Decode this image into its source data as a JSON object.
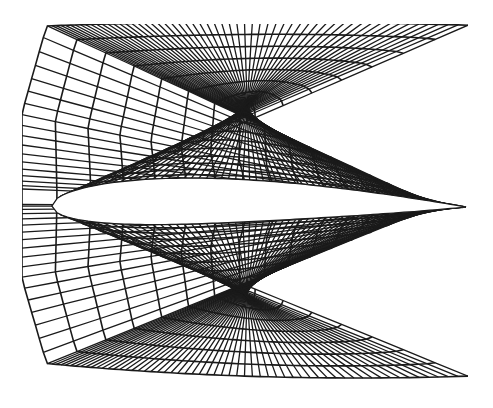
{
  "figure": {
    "title": "",
    "background": "#ffffff",
    "line_color": "#1a1a1a",
    "mesh": {
      "left": 22,
      "right": 468,
      "top": 24,
      "bottom": 380,
      "wall_layers_above": 16,
      "wall_layers_below": 14,
      "streamwise_lines": 150
    },
    "airfoil": {
      "leading_edge": [
        52,
        206
      ],
      "trailing_edge": [
        466,
        207
      ],
      "fill": "#ffffff"
    }
  }
}
